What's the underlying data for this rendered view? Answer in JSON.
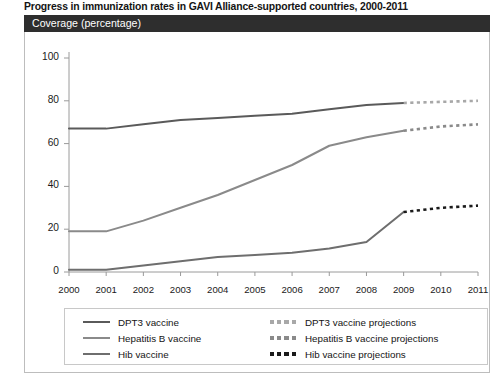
{
  "chart_data": {
    "type": "line",
    "title": "Progress in immunization rates in GAVI Alliance-supported countries, 2000-2011",
    "ylabel": "Coverage (percentage)",
    "xlabel": "",
    "x": [
      2000,
      2001,
      2002,
      2003,
      2004,
      2005,
      2006,
      2007,
      2008,
      2009,
      2010,
      2011
    ],
    "xtick_labels": [
      "2000",
      "2001",
      "2002",
      "2003",
      "2004",
      "2005",
      "2006",
      "2007",
      "2008",
      "2009",
      "2010",
      "2011"
    ],
    "ytick_labels": [
      "0",
      "20",
      "40",
      "60",
      "80",
      "100"
    ],
    "yticks": [
      0,
      20,
      40,
      60,
      80,
      100
    ],
    "ylim": [
      0,
      100
    ],
    "xlim": [
      2000,
      2011
    ],
    "grid": false,
    "legend_position": "bottom",
    "series": [
      {
        "name": "DPT3 vaccine",
        "style": "solid",
        "color": "#5a5a5a",
        "x": [
          2000,
          2001,
          2002,
          2003,
          2004,
          2005,
          2006,
          2007,
          2008,
          2009
        ],
        "values": [
          67,
          67,
          69,
          71,
          72,
          73,
          74,
          76,
          78,
          79
        ]
      },
      {
        "name": "Hepatitis B vaccine",
        "style": "solid",
        "color": "#8a8a8a",
        "x": [
          2000,
          2001,
          2002,
          2003,
          2004,
          2005,
          2006,
          2007,
          2008,
          2009
        ],
        "values": [
          19,
          19,
          24,
          30,
          36,
          43,
          50,
          59,
          63,
          66
        ]
      },
      {
        "name": "Hib vaccine",
        "style": "solid",
        "color": "#6e6e6e",
        "x": [
          2000,
          2001,
          2002,
          2003,
          2004,
          2005,
          2006,
          2007,
          2008,
          2009
        ],
        "values": [
          1,
          1,
          3,
          5,
          7,
          8,
          9,
          11,
          14,
          28
        ]
      },
      {
        "name": "DPT3 vaccine projections",
        "style": "dashed",
        "color": "#a8a8a8",
        "x": [
          2009,
          2010,
          2011
        ],
        "values": [
          79,
          79.5,
          80
        ]
      },
      {
        "name": "Hepatitis B vaccine projections",
        "style": "dashed",
        "color": "#8a8a8a",
        "x": [
          2009,
          2010,
          2011
        ],
        "values": [
          66,
          68,
          69
        ]
      },
      {
        "name": "Hib vaccine projections",
        "style": "dashed",
        "color": "#1a1a1a",
        "x": [
          2009,
          2010,
          2011
        ],
        "values": [
          28,
          30,
          31
        ]
      }
    ]
  },
  "legend": {
    "solid_entries": [
      {
        "label": "DPT3 vaccine",
        "color": "#5a5a5a"
      },
      {
        "label": "Hepatitis B vaccine",
        "color": "#8a8a8a"
      },
      {
        "label": "Hib vaccine",
        "color": "#6e6e6e"
      }
    ],
    "dashed_entries": [
      {
        "label": "DPT3 vaccine projections",
        "color": "#a8a8a8"
      },
      {
        "label": "Hepatitis B vaccine projections",
        "color": "#8a8a8a"
      },
      {
        "label": "Hib vaccine projections",
        "color": "#1a1a1a"
      }
    ]
  }
}
